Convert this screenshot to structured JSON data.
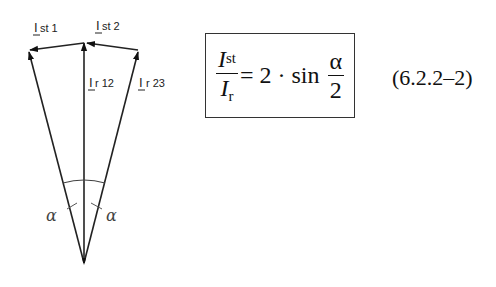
{
  "diagram": {
    "vectors": {
      "rotor_left_label": "I",
      "stator_labels": [
        {
          "main": "I",
          "sub": "st 1"
        },
        {
          "main": "I",
          "sub": "st 2"
        }
      ],
      "rotor_labels": [
        {
          "main": "I",
          "sub": "r 12"
        },
        {
          "main": "I",
          "sub": "r 23"
        }
      ]
    },
    "angles": [
      {
        "symbol": "α"
      },
      {
        "symbol": "α"
      }
    ]
  },
  "equation": {
    "lhs_num_main": "I",
    "lhs_num_sub": "st",
    "lhs_den_main": "I",
    "lhs_den_sub": "r",
    "equals": "=",
    "coef": "2",
    "dot": "·",
    "func": "sin",
    "rhs_num": "α",
    "rhs_den": "2"
  },
  "equation_number": "(6.2.2–2)"
}
